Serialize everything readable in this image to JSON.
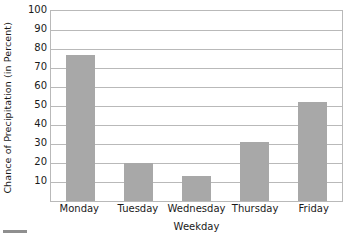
{
  "chart_data": {
    "type": "bar",
    "title": "",
    "subtitle": "",
    "xlabel": "Weekday",
    "ylabel": "Chance of Precipitation (in Percent)",
    "categories": [
      "Monday",
      "Tuesday",
      "Wednesday",
      "Thursday",
      "Friday"
    ],
    "values": [
      77,
      20,
      13,
      31,
      52
    ],
    "ylim": [
      0,
      100
    ],
    "y_ticks": [
      10,
      20,
      30,
      40,
      50,
      60,
      70,
      80,
      90,
      100
    ],
    "y_tick_labels": [
      "10",
      "20",
      "30",
      "40",
      "50",
      "60",
      "70",
      "80",
      "90",
      "100"
    ],
    "grid": "horizontal",
    "legend": "none",
    "bar_color": "#a8a8a8",
    "gridline_color": "#b9b9b9",
    "axis_border_color": "#b9b9b9",
    "background_color": "#ffffff",
    "marker_color": "#8f8f8f"
  },
  "axes": {
    "y_title": "Chance of Precipitation (in Percent)",
    "x_title": "Weekday"
  }
}
